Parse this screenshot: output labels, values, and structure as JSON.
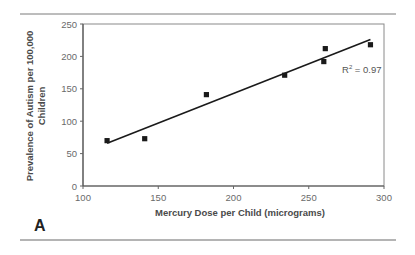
{
  "figure": {
    "panel_label": "A"
  },
  "chart_data": {
    "type": "scatter",
    "title": "",
    "xlabel": "Mercury Dose per Child (micrograms)",
    "ylabel_line1": "Prevalence of Autism per 100,000",
    "ylabel_line2": "Children",
    "xlim": [
      100,
      300
    ],
    "ylim": [
      0,
      250
    ],
    "xticks": [
      100,
      150,
      200,
      250,
      300
    ],
    "yticks": [
      0,
      50,
      100,
      150,
      200,
      250
    ],
    "grid": false,
    "legend": "none",
    "series": [
      {
        "name": "Observations",
        "marker": "square",
        "color": "#1a1a1a",
        "points": [
          {
            "x": 116,
            "y": 70
          },
          {
            "x": 141,
            "y": 73
          },
          {
            "x": 182,
            "y": 141
          },
          {
            "x": 234,
            "y": 171
          },
          {
            "x": 260,
            "y": 192
          },
          {
            "x": 261,
            "y": 212
          },
          {
            "x": 291,
            "y": 218
          }
        ]
      }
    ],
    "trendline": {
      "type": "linear",
      "x_start": 116,
      "x_end": 291,
      "y_start": 66,
      "y_end": 226,
      "color": "#1a1a1a"
    },
    "annotations": [
      {
        "text_main": "R",
        "text_sup": "2",
        "text_rest": " = 0.97"
      }
    ]
  }
}
